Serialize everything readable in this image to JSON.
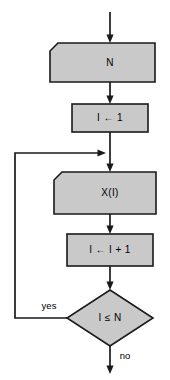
{
  "diagram": {
    "colors": {
      "shape_fill": "#c9c9c9",
      "stroke": "#1a1a1a",
      "background": "#ffffff",
      "text": "#000000"
    },
    "nodes": [
      {
        "id": "input-n",
        "shape": "io-parallelogram",
        "label": "N"
      },
      {
        "id": "init-i",
        "shape": "process-rectangle",
        "label": "I ← 1"
      },
      {
        "id": "output-xi",
        "shape": "io-parallelogram",
        "label": "X(I)"
      },
      {
        "id": "increment-i",
        "shape": "process-rectangle",
        "label": "I ← I + 1"
      },
      {
        "id": "decision-i-le-n",
        "shape": "decision-diamond",
        "label": "I ≤ N"
      }
    ],
    "edge_labels": {
      "yes": "yes",
      "no": "no"
    }
  }
}
